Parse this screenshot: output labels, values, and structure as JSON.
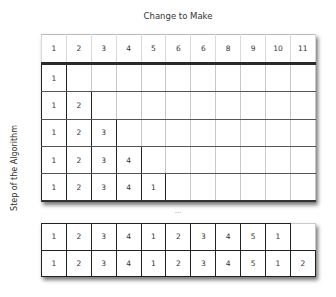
{
  "title": "Change to Make",
  "y_axis_label": "Step of the Algorithm",
  "ellipsis": "...",
  "header_row": [
    "1",
    "2",
    "3",
    "4",
    "5",
    "6",
    "6",
    "8",
    "9",
    "10",
    "11"
  ],
  "top_rows": [
    [
      "1",
      "",
      "",
      "",
      "",
      "",
      "",
      "",
      "",
      "",
      ""
    ],
    [
      "1",
      "2",
      "",
      "",
      "",
      "",
      "",
      "",
      "",
      "",
      ""
    ],
    [
      "1",
      "2",
      "3",
      "",
      "",
      "",
      "",
      "",
      "",
      "",
      ""
    ],
    [
      "1",
      "2",
      "3",
      "4",
      "",
      "",
      "",
      "",
      "",
      "",
      ""
    ],
    [
      "1",
      "2",
      "3",
      "4",
      "1",
      "",
      "",
      "",
      "",
      "",
      ""
    ]
  ],
  "bottom_rows": [
    [
      "1",
      "2",
      "3",
      "4",
      "1",
      "2",
      "3",
      "4",
      "5",
      "1",
      ""
    ],
    [
      "1",
      "2",
      "3",
      "4",
      "1",
      "2",
      "3",
      "4",
      "5",
      "1",
      "2"
    ]
  ]
}
